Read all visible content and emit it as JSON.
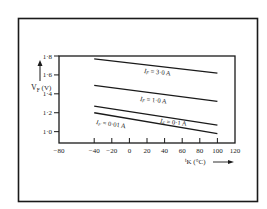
{
  "chart_data": {
    "type": "line",
    "title": "",
    "xlabel": "tK (°C)",
    "xlabel_main": "t",
    "xlabel_sub": "K",
    "xlabel_unit": " (°C)",
    "ylabel": "VF (V)",
    "ylabel_main": "V",
    "ylabel_sub": "F",
    "ylabel_unit": " (V)",
    "xlim": [
      -80,
      120
    ],
    "ylim": [
      0.88,
      1.8
    ],
    "x_ticks": [
      -80,
      -40,
      -20,
      0,
      20,
      40,
      60,
      80,
      100,
      120
    ],
    "x_tick_labels": [
      "-80",
      "-40",
      "-20",
      "0",
      "20",
      "40",
      "60",
      "80",
      "100",
      "120"
    ],
    "y_ticks": [
      1.0,
      1.2,
      1.4,
      1.6,
      1.8
    ],
    "y_tick_labels": [
      "1·0",
      "1·2",
      "1·4",
      "1·6",
      "1·8"
    ],
    "grid": false,
    "legend_position": "inline labels",
    "x": [
      -40,
      100
    ],
    "series": [
      {
        "name": "IF = 3·0 A",
        "label_main": "I",
        "label_sub": "F",
        "label_rest": " = 3·0 A",
        "values": [
          1.77,
          1.62
        ]
      },
      {
        "name": "IF = 1·0 A",
        "label_main": "I",
        "label_sub": "F",
        "label_rest": " = 1·0 A",
        "values": [
          1.49,
          1.32
        ]
      },
      {
        "name": "IF = 0·1 A",
        "label_main": "I",
        "label_sub": "F",
        "label_rest": " = 0·1 A",
        "values": [
          1.27,
          1.07
        ]
      },
      {
        "name": "IF = 0·01 A",
        "label_main": "I",
        "label_sub": "F",
        "label_rest": " = 0·01 A",
        "values": [
          1.2,
          0.98
        ]
      }
    ]
  }
}
